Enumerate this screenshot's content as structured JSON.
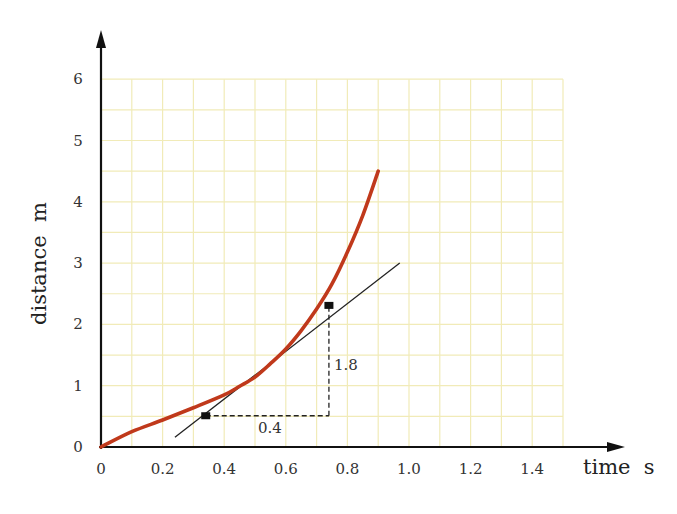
{
  "chart_data": {
    "type": "line",
    "title": "",
    "xlabel": "time  s",
    "ylabel": "distance  m",
    "xlim": [
      0,
      1.5
    ],
    "ylim": [
      0,
      6
    ],
    "grid": true,
    "grid_minor_x": 0.1,
    "grid_minor_y": 0.5,
    "x_ticks": [
      0,
      0.2,
      0.4,
      0.6,
      0.8,
      1.0,
      1.2,
      1.4
    ],
    "x_tick_labels": [
      "0",
      "0.2",
      "0.4",
      "0.6",
      "0.8",
      "1.0",
      "1.2",
      "1.4"
    ],
    "y_ticks": [
      0,
      1,
      2,
      3,
      4,
      5,
      6
    ],
    "y_tick_labels": [
      "0",
      "1",
      "2",
      "3",
      "4",
      "5",
      "6"
    ],
    "series": [
      {
        "name": "distance-time curve",
        "color": "#c0391b",
        "x": [
          0,
          0.1,
          0.2,
          0.3,
          0.4,
          0.45,
          0.5,
          0.55,
          0.6,
          0.65,
          0.7,
          0.75,
          0.8,
          0.85,
          0.9
        ],
        "y": [
          0,
          0.25,
          0.44,
          0.64,
          0.85,
          0.99,
          1.14,
          1.36,
          1.6,
          1.9,
          2.25,
          2.66,
          3.18,
          3.78,
          4.5
        ]
      }
    ],
    "tangent": {
      "name": "tangent line",
      "color": "#222222",
      "x": [
        0.24,
        0.97
      ],
      "y": [
        0.16,
        3.0
      ]
    },
    "markers": [
      {
        "x": 0.34,
        "y": 0.51
      },
      {
        "x": 0.74,
        "y": 2.31
      }
    ],
    "annotations": [
      {
        "text": "0.4",
        "meaning": "run (Δt)"
      },
      {
        "text": "1.8",
        "meaning": "rise (Δd)"
      }
    ]
  },
  "labels": {
    "x_axis": "time  s",
    "y_axis": "distance  m",
    "run": "0.4",
    "rise": "1.8"
  },
  "colors": {
    "grid": "#f1ebb8",
    "curve": "#c0391b",
    "axes": "#111111"
  }
}
